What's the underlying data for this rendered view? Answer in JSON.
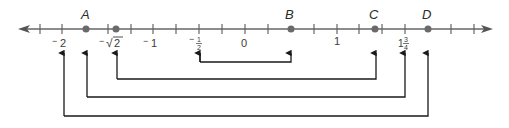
{
  "diagram": {
    "type": "number-line",
    "range": [
      -2.5,
      2.5
    ],
    "tick_step": 0.25,
    "colors": {
      "line": "#666666",
      "point": "#6a6a6a",
      "arrow": "#1a1a1a",
      "text": "#3a3a3a"
    },
    "points": [
      {
        "label": "A",
        "value": -1.5
      },
      {
        "label": "",
        "value": -1.414
      },
      {
        "label": "B",
        "value": 0.5
      },
      {
        "label": "C",
        "value": 1.414
      },
      {
        "label": "D",
        "value": 2
      }
    ],
    "tick_labels": [
      {
        "text": "⁻2",
        "value": -2
      },
      {
        "text": "⁻√2",
        "value": -1.414
      },
      {
        "text": "⁻1",
        "value": -1
      },
      {
        "text": "⁻½",
        "value": -0.5
      },
      {
        "text": "0",
        "value": 0
      },
      {
        "text": "1",
        "value": 1
      },
      {
        "text": "1¾",
        "value": 1.75
      }
    ],
    "labels": {
      "A": "A",
      "B": "B",
      "C": "C",
      "D": "D",
      "neg2_sign": "−",
      "neg2_num": "2",
      "negsqrt2_sign": "−",
      "negsqrt2_root": "√",
      "negsqrt2_num": "2",
      "neg1_sign": "−",
      "neg1_num": "1",
      "neghalf_sign": "−",
      "neghalf_num": "1",
      "neghalf_den": "2",
      "zero": "0",
      "one": "1",
      "onethreequarter_whole": "1",
      "onethreequarter_num": "3",
      "onethreequarter_den": "4"
    },
    "brackets": [
      {
        "from": "-1/2",
        "to": "B"
      },
      {
        "from": "-√2",
        "to": "C"
      },
      {
        "from": "A",
        "to": "1 3/4"
      },
      {
        "from": "-2",
        "to": "D"
      }
    ]
  }
}
